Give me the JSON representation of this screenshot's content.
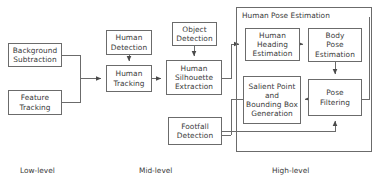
{
  "diagram": {
    "group": {
      "label": "Human Pose Estimation"
    },
    "nodes": {
      "background_subtraction": "Background\nSubtraction",
      "feature_tracking": "Feature\nTracking",
      "human_detection": "Human\nDetection",
      "human_tracking": "Human\nTracking",
      "object_detection": "Object\nDetection",
      "human_silhouette_extraction": "Human\nSilhouette\nExtraction",
      "footfall_detection": "Footfall\nDetection",
      "human_heading_estimation": "Human\nHeading\nEstimation",
      "body_pose_estimation": "Body\nPose\nEstimation",
      "salient_point_bounding_box": "Salient Point\nand\nBounding Box\nGeneration",
      "pose_filtering": "Pose\nFiltering"
    },
    "levels": {
      "low": "Low-level",
      "mid": "Mid-level",
      "high": "High-level"
    },
    "colors": {
      "stroke": "#6b6b6b",
      "text": "#3a3a3a",
      "background": "#ffffff"
    }
  }
}
